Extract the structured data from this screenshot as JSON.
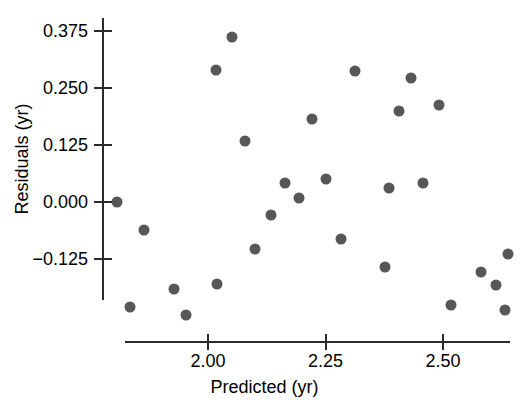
{
  "chart_data": {
    "type": "scatter",
    "title": "",
    "xlabel": "Predicted (yr)",
    "ylabel": "Residuals (yr)",
    "xticks": [
      2.0,
      2.25,
      2.5
    ],
    "xtick_labels": [
      "2.00",
      "2.25",
      "2.50"
    ],
    "yticks": [
      0.375,
      0.25,
      0.125,
      0.0,
      -0.125
    ],
    "ytick_labels": [
      "0.375",
      "0.250",
      "0.125",
      "0.000",
      "−0.125"
    ],
    "xlim": [
      1.785,
      2.655
    ],
    "ylim": [
      -0.305,
      0.415
    ],
    "grid": false,
    "legend": null,
    "marker": {
      "shape": "circle",
      "color": "#575757",
      "size_px": 11
    },
    "axis_color": "#2b2b2b",
    "background": "#ffffff",
    "points": [
      {
        "x": 2.05,
        "y": 0.362
      },
      {
        "x": 2.018,
        "y": 0.29
      },
      {
        "x": 2.313,
        "y": 0.287
      },
      {
        "x": 2.431,
        "y": 0.272
      },
      {
        "x": 2.407,
        "y": 0.2
      },
      {
        "x": 2.491,
        "y": 0.213
      },
      {
        "x": 2.222,
        "y": 0.182
      },
      {
        "x": 2.078,
        "y": 0.134
      },
      {
        "x": 2.163,
        "y": 0.042
      },
      {
        "x": 2.25,
        "y": 0.05
      },
      {
        "x": 2.385,
        "y": 0.031
      },
      {
        "x": 2.458,
        "y": 0.042
      },
      {
        "x": 2.194,
        "y": 0.009
      },
      {
        "x": 1.806,
        "y": 0.0
      },
      {
        "x": 2.133,
        "y": -0.029
      },
      {
        "x": 1.864,
        "y": -0.061
      },
      {
        "x": 2.101,
        "y": -0.103
      },
      {
        "x": 2.284,
        "y": -0.081
      },
      {
        "x": 1.928,
        "y": -0.191
      },
      {
        "x": 2.02,
        "y": -0.18
      },
      {
        "x": 2.377,
        "y": -0.143
      },
      {
        "x": 2.639,
        "y": -0.114
      },
      {
        "x": 2.581,
        "y": -0.154
      },
      {
        "x": 2.613,
        "y": -0.182
      },
      {
        "x": 1.834,
        "y": -0.23
      },
      {
        "x": 1.954,
        "y": -0.248
      },
      {
        "x": 2.517,
        "y": -0.226
      },
      {
        "x": 2.631,
        "y": -0.237
      }
    ]
  }
}
